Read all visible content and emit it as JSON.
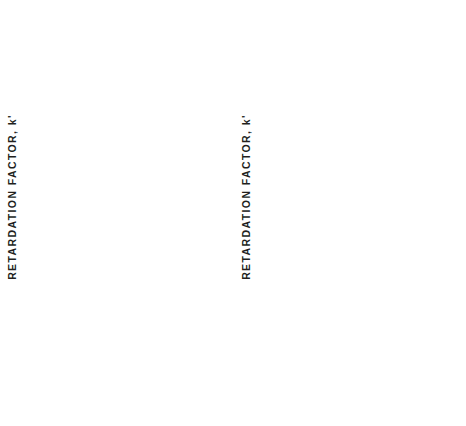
{
  "figure": {
    "width": 466,
    "height": 426,
    "background": "#ffffff",
    "ink_color": "#2b2926"
  },
  "axis_titles": {
    "y": "RETARDATION FACTOR, k'",
    "x": "pH"
  },
  "panels": [
    {
      "letter": "A"
    },
    {
      "letter": "B"
    }
  ],
  "chart_data": [
    {
      "type": "line",
      "panel": "A",
      "title": "A",
      "xlabel": "pH",
      "ylabel": "RETARDATION FACTOR, k'",
      "xlim": [
        1,
        7.6
      ],
      "ylim": [
        0,
        5
      ],
      "xticks": [
        1,
        3,
        5,
        7
      ],
      "xticks_minor": [
        2,
        4,
        6
      ],
      "yticks": [
        1,
        2,
        3,
        4,
        5
      ],
      "yticks_minor": [
        0.5,
        1.5,
        2.5,
        3.5,
        4.5
      ],
      "grid": false,
      "legend_position": "inline-left-of-curve",
      "series": [
        {
          "name": "HVA",
          "marker": "open-square",
          "label_x": 1.35,
          "label_y": 4.78,
          "x": [
            2.05,
            2.4,
            3.45,
            4.55,
            5.2,
            5.75,
            6.15,
            6.5,
            6.85,
            7.15,
            7.4
          ],
          "y": [
            4.8,
            4.8,
            4.45,
            3.68,
            1.72,
            0.92,
            0.62,
            0.45,
            0.33,
            0.25,
            0.2
          ]
        },
        {
          "name": "DOPAC",
          "marker": "open-triangle",
          "label_x": 1.3,
          "label_y": 1.62,
          "x": [
            2.1,
            2.35,
            3.4,
            5.15,
            5.75,
            6.2,
            6.55,
            6.9,
            7.2,
            7.4
          ],
          "y": [
            1.45,
            1.46,
            1.33,
            0.62,
            0.38,
            0.25,
            0.2,
            0.15,
            0.13,
            0.12
          ]
        },
        {
          "name": "VMA",
          "marker": "open-circle",
          "label_x": 1.3,
          "label_y": 0.62,
          "x": [
            2.0,
            2.3,
            3.45,
            5.2,
            5.8,
            6.25,
            6.6,
            6.95,
            7.25,
            7.45
          ],
          "y": [
            0.6,
            0.6,
            0.55,
            0.33,
            0.22,
            0.16,
            0.13,
            0.1,
            0.09,
            0.08
          ]
        },
        {
          "name": "DOMA",
          "marker": "filled-circle",
          "label_x": 1.25,
          "label_y": 0.42,
          "x": [
            2.05,
            2.35,
            3.45,
            5.2,
            5.8,
            6.25,
            6.6,
            6.95,
            7.25,
            7.45
          ],
          "y": [
            0.42,
            0.42,
            0.38,
            0.2,
            0.12,
            0.08,
            0.07,
            0.06,
            0.05,
            0.05
          ]
        }
      ]
    },
    {
      "type": "line",
      "panel": "B",
      "title": "B",
      "xlabel": "pH",
      "ylabel": "RETARDATION FACTOR, k'",
      "xlim": [
        1,
        7.6
      ],
      "ylim": [
        0,
        5.75
      ],
      "xticks": [
        1,
        3,
        5,
        7
      ],
      "xticks_minor": [
        2,
        4,
        6
      ],
      "yticks": [
        1,
        2,
        3,
        4,
        5
      ],
      "yticks_minor": [
        0.5,
        1.5,
        2.5,
        3.5,
        4.5,
        5.5
      ],
      "grid": false,
      "legend_position": "inline-left-of-curve",
      "series": [
        {
          "name": "PN",
          "marker": "open-circle-small",
          "label_x": 1.3,
          "label_y": 2.93,
          "x": [
            3.4,
            4.25,
            5.3,
            5.75
          ],
          "y": [
            2.95,
            2.85,
            3.98,
            5.25
          ]
        },
        {
          "name": "MOA",
          "marker": "filled-circle",
          "label_x": 1.25,
          "label_y": 1.4,
          "x": [
            2.05,
            2.35,
            3.45,
            5.2,
            5.85,
            6.3,
            6.6,
            6.85,
            7.05
          ],
          "y": [
            1.4,
            1.4,
            1.4,
            1.62,
            2.0,
            2.55,
            3.4,
            4.15,
            5.65
          ]
        },
        {
          "name": "MN",
          "marker": "open-triangle",
          "label_x": 1.3,
          "label_y": 1.0,
          "x": [
            2.0,
            2.3,
            3.45,
            5.25,
            5.95,
            6.45,
            6.8,
            7.05,
            7.25
          ],
          "y": [
            0.98,
            0.98,
            0.98,
            1.1,
            1.35,
            1.9,
            2.6,
            3.85,
            5.2
          ]
        },
        {
          "name": "TA",
          "marker": "filled-square",
          "label_x": 1.3,
          "label_y": 0.62,
          "x": [
            2.15,
            2.4,
            3.45,
            5.25,
            6.0,
            6.45,
            6.8,
            7.1,
            7.3
          ],
          "y": [
            0.6,
            0.6,
            0.6,
            0.68,
            0.98,
            1.4,
            2.0,
            3.5,
            5.0
          ]
        },
        {
          "name": "E",
          "marker": "filled-triangle",
          "label_x": 1.3,
          "label_y": 0.42,
          "x": [
            2.05,
            2.35,
            3.45,
            5.3,
            6.05,
            6.5,
            6.85,
            7.15,
            7.4
          ],
          "y": [
            0.4,
            0.4,
            0.4,
            0.48,
            0.62,
            0.88,
            1.35,
            1.78,
            5.68
          ]
        },
        {
          "name": "NE",
          "marker": "open-square",
          "label_x": 1.3,
          "label_y": 0.22,
          "x": [
            2.05,
            2.3,
            3.45,
            5.35,
            6.1,
            6.55,
            6.9,
            7.2,
            7.4
          ],
          "y": [
            0.2,
            0.2,
            0.2,
            0.25,
            0.3,
            0.42,
            0.6,
            0.85,
            1.08
          ]
        }
      ]
    }
  ]
}
